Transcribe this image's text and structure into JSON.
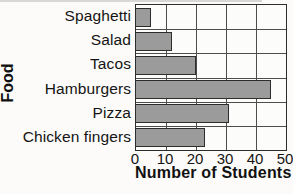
{
  "figure": {
    "background": "#fcfbf9",
    "bar_fill": "#9b9b9b",
    "bar_border": "#2d2d2d",
    "grid_color": "#4d4d4d",
    "axis_color": "#2d2d2d",
    "text_color": "#141414"
  },
  "chart_data": {
    "type": "bar",
    "orientation": "horizontal",
    "title": "",
    "xlabel": "Number of Students",
    "ylabel": "Food",
    "categories": [
      "Spaghetti",
      "Salad",
      "Tacos",
      "Hamburgers",
      "Pizza",
      "Chicken fingers"
    ],
    "values": [
      5,
      12,
      20,
      45,
      31,
      23
    ],
    "xlim": [
      0,
      50
    ],
    "xticks": [
      0,
      10,
      20,
      30,
      40,
      50
    ],
    "grid": true,
    "legend": false
  }
}
